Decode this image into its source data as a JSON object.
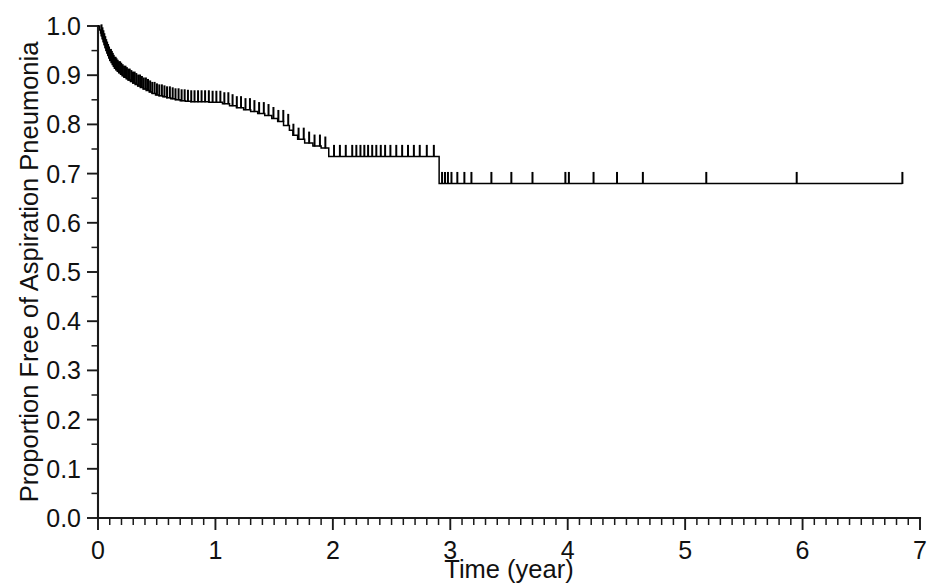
{
  "chart_data": {
    "type": "line",
    "subtype": "kaplan-meier-survival",
    "title": "",
    "xlabel": "Time (year)",
    "ylabel": "Proportion Free of Aspiration Pneumonia",
    "xlim": [
      0,
      7
    ],
    "ylim": [
      0.0,
      1.0
    ],
    "grid": false,
    "legend": null,
    "x_ticks": [
      0,
      1,
      2,
      3,
      4,
      5,
      6,
      7
    ],
    "x_tick_labels": [
      "0",
      "1",
      "2",
      "3",
      "4",
      "5",
      "6",
      "7"
    ],
    "x_minor_tick_interval": 0.1,
    "y_ticks": [
      0.0,
      0.1,
      0.2,
      0.3,
      0.4,
      0.5,
      0.6,
      0.7,
      0.8,
      0.9,
      1.0
    ],
    "y_tick_labels": [
      "0.0",
      "0.1",
      "0.2",
      "0.3",
      "0.4",
      "0.5",
      "0.6",
      "0.7",
      "0.8",
      "0.9",
      "1.0"
    ],
    "y_minor_tick_interval": 0.05,
    "series": [
      {
        "name": "Aspiration pneumonia free survival",
        "color": "#000000",
        "step": "post",
        "x": [
          0.0,
          0.015,
          0.022,
          0.03,
          0.038,
          0.046,
          0.054,
          0.062,
          0.07,
          0.078,
          0.086,
          0.094,
          0.102,
          0.112,
          0.122,
          0.132,
          0.142,
          0.152,
          0.165,
          0.178,
          0.192,
          0.206,
          0.222,
          0.24,
          0.258,
          0.276,
          0.296,
          0.316,
          0.338,
          0.36,
          0.384,
          0.41,
          0.436,
          0.462,
          0.49,
          0.52,
          0.552,
          0.586,
          0.62,
          0.66,
          0.7,
          0.745,
          0.79,
          0.84,
          0.89,
          0.945,
          1.0,
          1.06,
          1.12,
          1.18,
          1.24,
          1.3,
          1.36,
          1.42,
          1.48,
          1.53,
          1.58,
          1.63,
          1.66,
          1.7,
          1.76,
          1.83,
          1.9,
          1.965,
          2.905,
          6.85
        ],
        "y": [
          1.0,
          0.992,
          0.986,
          0.98,
          0.974,
          0.968,
          0.962,
          0.956,
          0.95,
          0.945,
          0.94,
          0.935,
          0.93,
          0.926,
          0.922,
          0.918,
          0.914,
          0.911,
          0.908,
          0.905,
          0.902,
          0.899,
          0.896,
          0.893,
          0.89,
          0.887,
          0.884,
          0.881,
          0.878,
          0.875,
          0.872,
          0.869,
          0.866,
          0.863,
          0.86,
          0.858,
          0.856,
          0.854,
          0.852,
          0.85,
          0.848,
          0.847,
          0.846,
          0.846,
          0.846,
          0.845,
          0.845,
          0.842,
          0.838,
          0.834,
          0.83,
          0.826,
          0.822,
          0.818,
          0.812,
          0.806,
          0.798,
          0.788,
          0.778,
          0.77,
          0.762,
          0.756,
          0.752,
          0.735,
          0.68,
          0.68
        ],
        "censored_times": [
          0.03,
          0.038,
          0.046,
          0.054,
          0.062,
          0.07,
          0.078,
          0.086,
          0.094,
          0.102,
          0.11,
          0.118,
          0.126,
          0.134,
          0.142,
          0.15,
          0.158,
          0.168,
          0.178,
          0.188,
          0.198,
          0.21,
          0.222,
          0.234,
          0.246,
          0.258,
          0.27,
          0.284,
          0.298,
          0.312,
          0.326,
          0.342,
          0.358,
          0.374,
          0.39,
          0.408,
          0.426,
          0.444,
          0.462,
          0.482,
          0.502,
          0.522,
          0.544,
          0.566,
          0.588,
          0.612,
          0.636,
          0.66,
          0.686,
          0.712,
          0.738,
          0.766,
          0.794,
          0.822,
          0.852,
          0.882,
          0.912,
          0.944,
          0.976,
          1.008,
          1.042,
          1.076,
          1.11,
          1.146,
          1.182,
          1.218,
          1.256,
          1.294,
          1.332,
          1.372,
          1.412,
          1.452,
          1.494,
          1.536,
          1.578,
          1.62,
          1.664,
          1.708,
          1.752,
          1.798,
          1.844,
          1.89,
          1.936,
          2.01,
          2.06,
          2.11,
          2.165,
          2.2,
          2.235,
          2.268,
          2.3,
          2.335,
          2.37,
          2.408,
          2.445,
          2.49,
          2.54,
          2.59,
          2.64,
          2.69,
          2.74,
          2.8,
          2.86,
          2.93,
          2.955,
          2.98,
          3.01,
          3.06,
          3.12,
          3.18,
          3.35,
          3.52,
          3.7,
          3.98,
          4.01,
          4.22,
          4.42,
          4.64,
          5.18,
          5.95,
          6.85
        ]
      }
    ],
    "annotations": []
  },
  "axes": {
    "y_axis_title": "Proportion Free of Aspiration Pneumonia",
    "x_axis_title": "Time (year)"
  }
}
